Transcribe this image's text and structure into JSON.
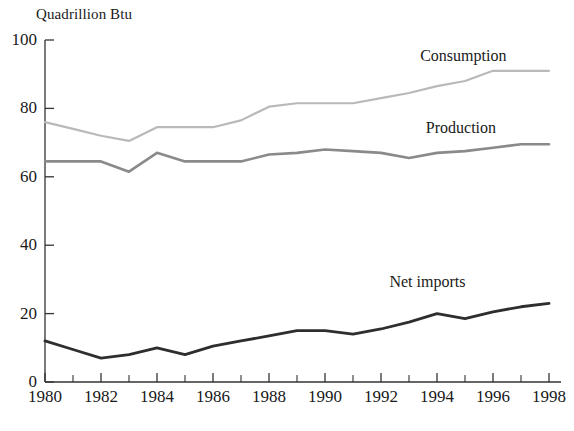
{
  "chart_data": {
    "type": "line",
    "title": "",
    "ylabel": "Quadrillion Btu",
    "xlabel": "",
    "xlim": [
      1980,
      1998
    ],
    "ylim": [
      0,
      100
    ],
    "grid": false,
    "legend_position": "inline-right-annotations",
    "x": [
      1980,
      1981,
      1982,
      1983,
      1984,
      1985,
      1986,
      1987,
      1988,
      1989,
      1990,
      1991,
      1992,
      1993,
      1994,
      1995,
      1996,
      1997,
      1998
    ],
    "ytick_labels": [
      "0",
      "20",
      "40",
      "60",
      "80",
      "100"
    ],
    "ytick_values": [
      0,
      20,
      40,
      60,
      80,
      100
    ],
    "xtick_labels": [
      "1980",
      "1982",
      "1984",
      "1986",
      "1988",
      "1990",
      "1992",
      "1994",
      "1996",
      "1998"
    ],
    "xtick_values": [
      1980,
      1982,
      1984,
      1986,
      1988,
      1990,
      1992,
      1994,
      1996,
      1998
    ],
    "xminor_values": [
      1981,
      1983,
      1985,
      1987,
      1989,
      1991,
      1993,
      1995,
      1997
    ],
    "series": [
      {
        "name": "Consumption",
        "color": "#b9b9b9",
        "width": 2.2,
        "label_x": 1993.4,
        "label_y": 95,
        "values": [
          76,
          74,
          72,
          70.5,
          74.5,
          74.5,
          74.5,
          76.5,
          80.5,
          81.5,
          81.5,
          81.5,
          83,
          84.5,
          86.5,
          88,
          91,
          91,
          91
        ]
      },
      {
        "name": "Production",
        "color": "#8a8a8a",
        "width": 2.6,
        "label_x": 1993.6,
        "label_y": 74,
        "values": [
          64.5,
          64.5,
          64.5,
          61.5,
          67,
          64.5,
          64.5,
          64.5,
          66.5,
          67,
          68,
          67.5,
          67,
          65.5,
          67,
          67.5,
          68.5,
          69.5,
          69.5
        ]
      },
      {
        "name": "Net imports",
        "color": "#2e2e2e",
        "width": 2.8,
        "label_x": 1992.3,
        "label_y": 29,
        "values": [
          12,
          9.5,
          7,
          8,
          10,
          8,
          10.5,
          12,
          13.5,
          15,
          15,
          14,
          15.5,
          17.5,
          20,
          18.5,
          20.5,
          22,
          23
        ]
      }
    ]
  }
}
